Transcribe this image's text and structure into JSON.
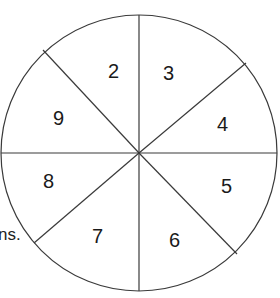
{
  "diagram": {
    "type": "spinner",
    "sections": [
      {
        "label": "2",
        "x": 108,
        "y": 78
      },
      {
        "label": "3",
        "x": 163,
        "y": 80
      },
      {
        "label": "4",
        "x": 217,
        "y": 131
      },
      {
        "label": "5",
        "x": 221,
        "y": 193
      },
      {
        "label": "6",
        "x": 169,
        "y": 247
      },
      {
        "label": "7",
        "x": 97,
        "y": 243
      },
      {
        "label": "8",
        "x": 49,
        "y": 188
      },
      {
        "label": "9",
        "x": 59,
        "y": 125
      }
    ],
    "stroke_color": "#3a3a3a"
  },
  "partial_text": "ns."
}
